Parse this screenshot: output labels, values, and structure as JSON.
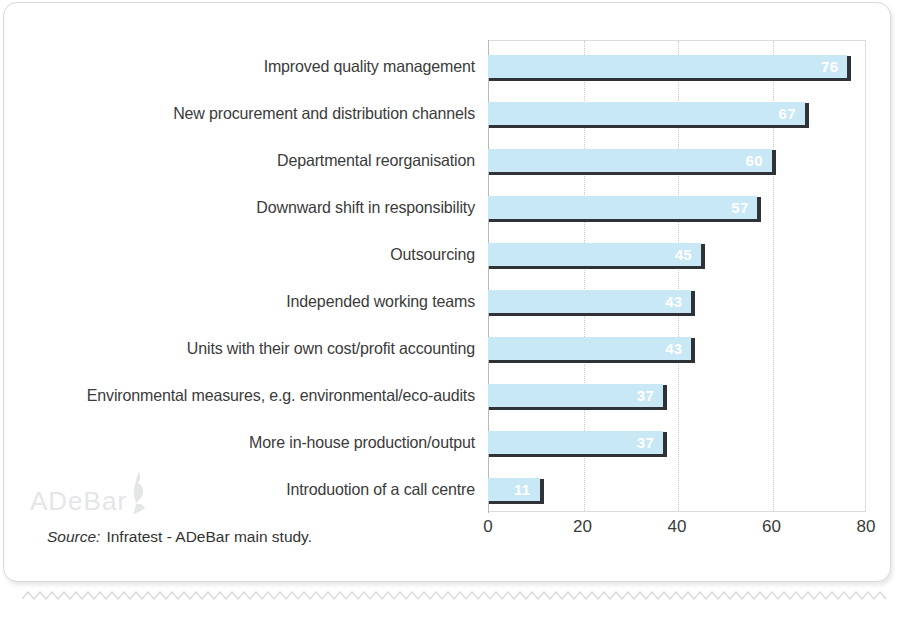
{
  "chart_data": {
    "type": "bar",
    "orientation": "horizontal",
    "title": "",
    "xlabel": "",
    "ylabel": "",
    "xlim": [
      0,
      80
    ],
    "xticks": [
      "0",
      "20",
      "40",
      "60",
      "80"
    ],
    "xtick_values": [
      0,
      20,
      40,
      60,
      80
    ],
    "grid": "vertical dotted gridlines",
    "legend": "none",
    "bar_color": "#c9e8f6",
    "bar_shadow_color": "#2f3338",
    "value_label_color": "#ffffff",
    "categories": [
      "Improved quality management",
      "New procurement and distribution channels",
      "Departmental reorganisation",
      "Downward shift in responsibility",
      "Outsourcing",
      "Independed working teams",
      "Units with their own cost/profit accounting",
      "Environmental measures, e.g. environmental/eco-audits",
      "More in-house production/output",
      "Introduotion of a call centre"
    ],
    "values": [
      76,
      67,
      60,
      57,
      45,
      43,
      43,
      37,
      37,
      11
    ],
    "value_labels": [
      "76",
      "67",
      "60",
      "57",
      "45",
      "43",
      "43",
      "37",
      "37",
      "11"
    ]
  },
  "footer": {
    "source_word": "Source:",
    "source_text": "Infratest - ADeBar main study."
  },
  "watermark": {
    "text": "ADeBar"
  }
}
